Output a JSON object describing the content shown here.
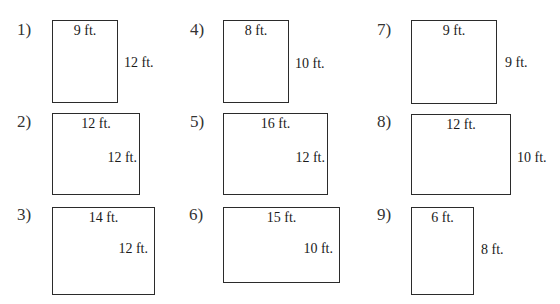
{
  "problems": [
    {
      "number": "1)",
      "width": "9 ft.",
      "height": "12 ft."
    },
    {
      "number": "2)",
      "width": "12 ft.",
      "height": "12 ft."
    },
    {
      "number": "3)",
      "width": "14 ft.",
      "height": "12 ft."
    },
    {
      "number": "4)",
      "width": "8 ft.",
      "height": "10 ft."
    },
    {
      "number": "5)",
      "width": "16 ft.",
      "height": "12 ft."
    },
    {
      "number": "6)",
      "width": "15 ft.",
      "height": "10 ft."
    },
    {
      "number": "7)",
      "width": "9 ft.",
      "height": "9 ft."
    },
    {
      "number": "8)",
      "width": "12 ft.",
      "height": "10 ft."
    },
    {
      "number": "9)",
      "width": "6 ft.",
      "height": "8 ft."
    }
  ]
}
